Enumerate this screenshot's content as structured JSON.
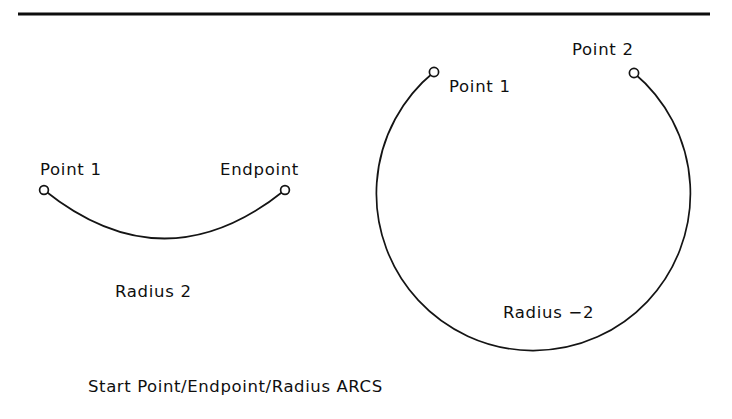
{
  "figure": {
    "caption": "Start Point/Endpoint/Radius ARCS",
    "ink_color": "#141414",
    "background_color": "#ffffff",
    "divider": {
      "name": "top-horizontal-rule",
      "x1": 18,
      "x2": 710,
      "y": 14
    },
    "arcs": [
      {
        "id": "left-arc",
        "name": "minor-arc-positive-radius",
        "radius_label": "Radius 2",
        "radius_label_pos": {
          "x": 115,
          "y": 297
        },
        "start_label": "Point 1",
        "start_label_pos": {
          "x": 40,
          "y": 175
        },
        "end_label": "Endpoint",
        "end_label_pos": {
          "x": 220,
          "y": 175
        },
        "start_node": {
          "cx": 44,
          "cy": 190
        },
        "end_node": {
          "cx": 285,
          "cy": 190
        },
        "path": "M 44 190 Q 164.5 287 285 190",
        "sweep_lowest_y": 238
      },
      {
        "id": "right-arc",
        "name": "major-arc-negative-radius",
        "radius_label": "Radius −2",
        "radius_label_pos": {
          "x": 503,
          "y": 318
        },
        "start_label": "Point 1",
        "start_label_pos": {
          "x": 449,
          "y": 92
        },
        "end_label": "Point 2",
        "end_label_pos": {
          "x": 572,
          "y": 55
        },
        "start_node": {
          "cx": 434,
          "cy": 72
        },
        "end_node": {
          "cx": 634,
          "cy": 73
        },
        "center": {
          "cx": 529,
          "cy": 206
        },
        "radius_px": 157,
        "path": "M 434 72 A 157 157 0 1 0 634 73",
        "node_radius_px": 4.6
      }
    ]
  }
}
